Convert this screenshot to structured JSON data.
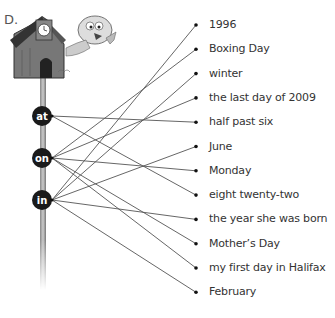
{
  "exercise": {
    "section_label": "D.",
    "prepositions": [
      {
        "id": "at",
        "label": "at"
      },
      {
        "id": "on",
        "label": "on"
      },
      {
        "id": "in",
        "label": "in"
      }
    ],
    "items": [
      {
        "label": "1996",
        "matched": "in"
      },
      {
        "label": "Boxing Day",
        "matched": "on"
      },
      {
        "label": "winter",
        "matched": "in"
      },
      {
        "label": "the last day of 2009",
        "matched": "on"
      },
      {
        "label": "half past six",
        "matched": "at"
      },
      {
        "label": "June",
        "matched": "in"
      },
      {
        "label": "Monday",
        "matched": "on"
      },
      {
        "label": "eight twenty-two",
        "matched": "at"
      },
      {
        "label": "the year she was born",
        "matched": "in"
      },
      {
        "label": "Mother’s Day",
        "matched": "on"
      },
      {
        "label": "my first day in Halifax",
        "matched": "on"
      },
      {
        "label": "February",
        "matched": "in"
      }
    ],
    "illustration": "birdhouse-with-clock-and-bird"
  }
}
